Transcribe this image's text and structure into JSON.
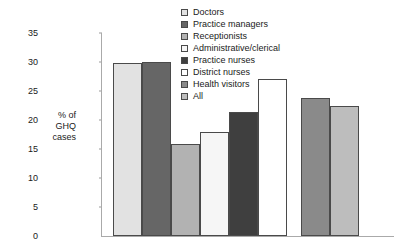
{
  "chart_data": {
    "type": "bar",
    "title": "",
    "xlabel": "",
    "ylabel": "% of GHQ cases",
    "ylabel_lines": [
      "% of",
      "GHQ",
      "cases"
    ],
    "ylim": [
      0,
      35
    ],
    "ytick_step": 5,
    "ytick_labels": [
      "0",
      "5",
      "10",
      "15",
      "20",
      "25",
      "30",
      "35"
    ],
    "ytick_values": [
      0,
      5,
      10,
      15,
      20,
      25,
      30,
      35
    ],
    "grid": false,
    "legend_position": "upper-right-inside",
    "categories": [
      "Doctors",
      "Practice managers",
      "Receptionists",
      "Administrative/clerical",
      "Practice nurses",
      "District nurses",
      "Health visitors",
      "All"
    ],
    "values": [
      29.8,
      30.0,
      15.8,
      17.9,
      21.4,
      27.0,
      23.8,
      22.5
    ],
    "colors": [
      "#e2e2e2",
      "#666666",
      "#b2b2b2",
      "#f6f6f6",
      "#3f3f3f",
      "#ffffff",
      "#8a8a8a",
      "#bdbdbd"
    ],
    "bar_edge_color": "#4a4a4a",
    "gap_after_index": 5
  },
  "legend": {
    "items": [
      {
        "label": "Doctors",
        "color": "#e2e2e2"
      },
      {
        "label": "Practice managers",
        "color": "#666666"
      },
      {
        "label": "Receptionists",
        "color": "#b2b2b2"
      },
      {
        "label": "Administrative/clerical",
        "color": "#f6f6f6"
      },
      {
        "label": "Practice nurses",
        "color": "#3f3f3f"
      },
      {
        "label": "District nurses",
        "color": "#ffffff"
      },
      {
        "label": "Health visitors",
        "color": "#8a8a8a"
      },
      {
        "label": "All",
        "color": "#bdbdbd"
      }
    ]
  }
}
